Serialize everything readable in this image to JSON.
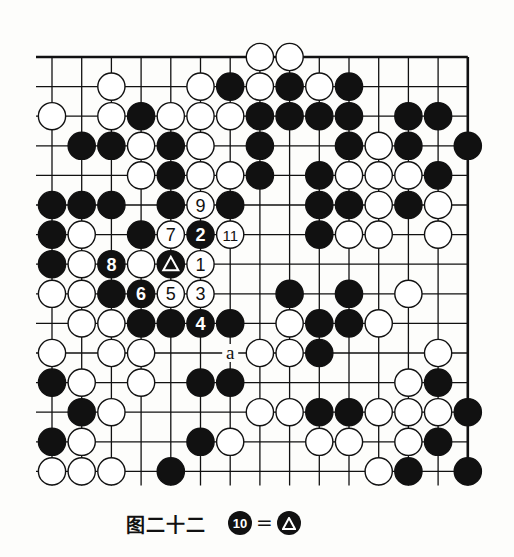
{
  "diagram": {
    "title": "图二十二",
    "note": {
      "move": "10",
      "equals": "=",
      "target": "triangle-marked stone"
    },
    "grid": {
      "cols": 15,
      "rows": 15,
      "x0": 52,
      "y0": 57,
      "dx": 29.7,
      "dy": 29.6,
      "edges": {
        "top": true,
        "right": true,
        "left": false,
        "bottom": false
      }
    },
    "colors": {
      "black": "#111111",
      "white": "#ffffff",
      "line": "#111111",
      "paper": "#fdfdfb"
    },
    "stones": [
      {
        "r": 0,
        "c": 7,
        "color": "W"
      },
      {
        "r": 0,
        "c": 8,
        "color": "W"
      },
      {
        "r": 1,
        "c": 2,
        "color": "W"
      },
      {
        "r": 1,
        "c": 5,
        "color": "W"
      },
      {
        "r": 1,
        "c": 6,
        "color": "B"
      },
      {
        "r": 1,
        "c": 7,
        "color": "W"
      },
      {
        "r": 1,
        "c": 8,
        "color": "B"
      },
      {
        "r": 1,
        "c": 9,
        "color": "W"
      },
      {
        "r": 1,
        "c": 10,
        "color": "B"
      },
      {
        "r": 2,
        "c": 0,
        "color": "W"
      },
      {
        "r": 2,
        "c": 2,
        "color": "W"
      },
      {
        "r": 2,
        "c": 3,
        "color": "B"
      },
      {
        "r": 2,
        "c": 4,
        "color": "W"
      },
      {
        "r": 2,
        "c": 5,
        "color": "W"
      },
      {
        "r": 2,
        "c": 6,
        "color": "W"
      },
      {
        "r": 2,
        "c": 7,
        "color": "B"
      },
      {
        "r": 2,
        "c": 8,
        "color": "B"
      },
      {
        "r": 2,
        "c": 9,
        "color": "B"
      },
      {
        "r": 2,
        "c": 10,
        "color": "B"
      },
      {
        "r": 2,
        "c": 12,
        "color": "B"
      },
      {
        "r": 2,
        "c": 13,
        "color": "B"
      },
      {
        "r": 3,
        "c": 1,
        "color": "B"
      },
      {
        "r": 3,
        "c": 2,
        "color": "B"
      },
      {
        "r": 3,
        "c": 3,
        "color": "W"
      },
      {
        "r": 3,
        "c": 4,
        "color": "B"
      },
      {
        "r": 3,
        "c": 5,
        "color": "W"
      },
      {
        "r": 3,
        "c": 7,
        "color": "B"
      },
      {
        "r": 3,
        "c": 10,
        "color": "B"
      },
      {
        "r": 3,
        "c": 11,
        "color": "W"
      },
      {
        "r": 3,
        "c": 12,
        "color": "B"
      },
      {
        "r": 3,
        "c": 14,
        "color": "B"
      },
      {
        "r": 4,
        "c": 3,
        "color": "W"
      },
      {
        "r": 4,
        "c": 4,
        "color": "B"
      },
      {
        "r": 4,
        "c": 5,
        "color": "W"
      },
      {
        "r": 4,
        "c": 6,
        "color": "W"
      },
      {
        "r": 4,
        "c": 7,
        "color": "B"
      },
      {
        "r": 4,
        "c": 9,
        "color": "B"
      },
      {
        "r": 4,
        "c": 10,
        "color": "W"
      },
      {
        "r": 4,
        "c": 11,
        "color": "W"
      },
      {
        "r": 4,
        "c": 12,
        "color": "W"
      },
      {
        "r": 4,
        "c": 13,
        "color": "B"
      },
      {
        "r": 5,
        "c": 0,
        "color": "B"
      },
      {
        "r": 5,
        "c": 1,
        "color": "B"
      },
      {
        "r": 5,
        "c": 2,
        "color": "B"
      },
      {
        "r": 5,
        "c": 4,
        "color": "B"
      },
      {
        "r": 5,
        "c": 5,
        "color": "W",
        "label": "9"
      },
      {
        "r": 5,
        "c": 6,
        "color": "B"
      },
      {
        "r": 5,
        "c": 9,
        "color": "B"
      },
      {
        "r": 5,
        "c": 10,
        "color": "B"
      },
      {
        "r": 5,
        "c": 11,
        "color": "W"
      },
      {
        "r": 5,
        "c": 12,
        "color": "B"
      },
      {
        "r": 5,
        "c": 13,
        "color": "W"
      },
      {
        "r": 6,
        "c": 0,
        "color": "B"
      },
      {
        "r": 6,
        "c": 1,
        "color": "W"
      },
      {
        "r": 6,
        "c": 3,
        "color": "B"
      },
      {
        "r": 6,
        "c": 4,
        "color": "W",
        "label": "7"
      },
      {
        "r": 6,
        "c": 5,
        "color": "B",
        "label": "2"
      },
      {
        "r": 6,
        "c": 6,
        "color": "W",
        "label": "11"
      },
      {
        "r": 6,
        "c": 9,
        "color": "B"
      },
      {
        "r": 6,
        "c": 10,
        "color": "W"
      },
      {
        "r": 6,
        "c": 11,
        "color": "W"
      },
      {
        "r": 6,
        "c": 13,
        "color": "W"
      },
      {
        "r": 7,
        "c": 0,
        "color": "B"
      },
      {
        "r": 7,
        "c": 1,
        "color": "W"
      },
      {
        "r": 7,
        "c": 2,
        "color": "B",
        "label": "8"
      },
      {
        "r": 7,
        "c": 3,
        "color": "W"
      },
      {
        "r": 7,
        "c": 4,
        "color": "B",
        "mark": "triangle"
      },
      {
        "r": 7,
        "c": 5,
        "color": "W",
        "label": "1"
      },
      {
        "r": 8,
        "c": 0,
        "color": "W"
      },
      {
        "r": 8,
        "c": 1,
        "color": "W"
      },
      {
        "r": 8,
        "c": 2,
        "color": "B"
      },
      {
        "r": 8,
        "c": 3,
        "color": "B",
        "label": "6"
      },
      {
        "r": 8,
        "c": 4,
        "color": "W",
        "label": "5"
      },
      {
        "r": 8,
        "c": 5,
        "color": "W",
        "label": "3"
      },
      {
        "r": 8,
        "c": 8,
        "color": "B"
      },
      {
        "r": 8,
        "c": 10,
        "color": "B"
      },
      {
        "r": 8,
        "c": 12,
        "color": "W"
      },
      {
        "r": 9,
        "c": 1,
        "color": "W"
      },
      {
        "r": 9,
        "c": 2,
        "color": "W"
      },
      {
        "r": 9,
        "c": 3,
        "color": "B"
      },
      {
        "r": 9,
        "c": 4,
        "color": "B"
      },
      {
        "r": 9,
        "c": 5,
        "color": "B",
        "label": "4"
      },
      {
        "r": 9,
        "c": 6,
        "color": "B"
      },
      {
        "r": 9,
        "c": 8,
        "color": "W"
      },
      {
        "r": 9,
        "c": 9,
        "color": "B"
      },
      {
        "r": 9,
        "c": 10,
        "color": "B"
      },
      {
        "r": 9,
        "c": 11,
        "color": "W"
      },
      {
        "r": 10,
        "c": 0,
        "color": "W"
      },
      {
        "r": 10,
        "c": 2,
        "color": "W"
      },
      {
        "r": 10,
        "c": 3,
        "color": "W"
      },
      {
        "r": 10,
        "c": 7,
        "color": "W"
      },
      {
        "r": 10,
        "c": 8,
        "color": "W"
      },
      {
        "r": 10,
        "c": 9,
        "color": "B"
      },
      {
        "r": 10,
        "c": 13,
        "color": "W"
      },
      {
        "r": 11,
        "c": 0,
        "color": "B"
      },
      {
        "r": 11,
        "c": 1,
        "color": "W"
      },
      {
        "r": 11,
        "c": 3,
        "color": "W"
      },
      {
        "r": 11,
        "c": 5,
        "color": "B"
      },
      {
        "r": 11,
        "c": 6,
        "color": "B"
      },
      {
        "r": 11,
        "c": 12,
        "color": "W"
      },
      {
        "r": 11,
        "c": 13,
        "color": "B"
      },
      {
        "r": 12,
        "c": 1,
        "color": "B"
      },
      {
        "r": 12,
        "c": 2,
        "color": "W"
      },
      {
        "r": 12,
        "c": 7,
        "color": "W"
      },
      {
        "r": 12,
        "c": 8,
        "color": "W"
      },
      {
        "r": 12,
        "c": 9,
        "color": "B"
      },
      {
        "r": 12,
        "c": 10,
        "color": "B"
      },
      {
        "r": 12,
        "c": 11,
        "color": "W"
      },
      {
        "r": 12,
        "c": 12,
        "color": "W"
      },
      {
        "r": 12,
        "c": 13,
        "color": "W"
      },
      {
        "r": 12,
        "c": 14,
        "color": "B"
      },
      {
        "r": 13,
        "c": 0,
        "color": "B"
      },
      {
        "r": 13,
        "c": 1,
        "color": "W"
      },
      {
        "r": 13,
        "c": 5,
        "color": "B"
      },
      {
        "r": 13,
        "c": 6,
        "color": "W"
      },
      {
        "r": 13,
        "c": 9,
        "color": "W"
      },
      {
        "r": 13,
        "c": 10,
        "color": "W"
      },
      {
        "r": 13,
        "c": 12,
        "color": "W"
      },
      {
        "r": 13,
        "c": 13,
        "color": "B"
      },
      {
        "r": 14,
        "c": 0,
        "color": "W"
      },
      {
        "r": 14,
        "c": 1,
        "color": "W"
      },
      {
        "r": 14,
        "c": 2,
        "color": "W"
      },
      {
        "r": 14,
        "c": 4,
        "color": "B"
      },
      {
        "r": 14,
        "c": 11,
        "color": "W"
      },
      {
        "r": 14,
        "c": 12,
        "color": "B"
      },
      {
        "r": 14,
        "c": 14,
        "color": "B"
      }
    ],
    "point_labels": [
      {
        "r": 10,
        "c": 6,
        "text": "a"
      }
    ]
  }
}
